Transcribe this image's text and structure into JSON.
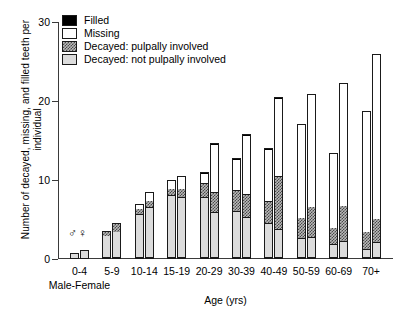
{
  "chart_data": {
    "type": "bar",
    "subtype": "stacked-grouped",
    "title": "",
    "xlabel": "Age (yrs)",
    "ylabel": "Number of decayed, missing, and filled teeth per individual",
    "ylim": [
      0,
      30
    ],
    "yticks": [
      0,
      10,
      20,
      30
    ],
    "grid": false,
    "legend_position": "top-left",
    "group_annotation": "Male-Female",
    "sex_symbols": {
      "male": "♂",
      "female": "♀"
    },
    "categories": [
      "0-4",
      "5-9",
      "10-14",
      "15-19",
      "20-29",
      "30-39",
      "40-49",
      "50-59",
      "60-69",
      "70+"
    ],
    "segments": [
      {
        "name": "Decayed: not pulpally involved",
        "key": "nopulp",
        "color": "#dcdcdc"
      },
      {
        "name": "Decayed: pulpally involved",
        "key": "pulp",
        "color": "#b9b9b9"
      },
      {
        "name": "Missing",
        "key": "missing",
        "color": "#ffffff"
      },
      {
        "name": "Filled",
        "key": "filled",
        "color": "#000000"
      }
    ],
    "series": [
      {
        "name": "Male",
        "bars": [
          {
            "category": "0-4",
            "nopulp": 0.7,
            "pulp": 0.0,
            "missing": 0.0,
            "filled": 0.0,
            "total": 0.7
          },
          {
            "category": "5-9",
            "nopulp": 3.0,
            "pulp": 0.5,
            "missing": 0.0,
            "filled": 0.0,
            "total": 3.5
          },
          {
            "category": "10-14",
            "nopulp": 5.7,
            "pulp": 0.7,
            "missing": 0.6,
            "filled": 0.0,
            "total": 7.0
          },
          {
            "category": "15-19",
            "nopulp": 8.0,
            "pulp": 1.0,
            "missing": 1.0,
            "filled": 0.0,
            "total": 10.0
          },
          {
            "category": "20-29",
            "nopulp": 7.8,
            "pulp": 1.8,
            "missing": 1.3,
            "filled": 0.1,
            "total": 11.0
          },
          {
            "category": "30-39",
            "nopulp": 6.0,
            "pulp": 2.6,
            "missing": 4.0,
            "filled": 0.2,
            "total": 12.8
          },
          {
            "category": "40-49",
            "nopulp": 4.4,
            "pulp": 2.8,
            "missing": 6.7,
            "filled": 0.2,
            "total": 14.1
          },
          {
            "category": "50-59",
            "nopulp": 2.4,
            "pulp": 2.7,
            "missing": 12.0,
            "filled": 0.0,
            "total": 17.1
          },
          {
            "category": "60-69",
            "nopulp": 1.7,
            "pulp": 2.2,
            "missing": 9.5,
            "filled": 0.0,
            "total": 13.4
          },
          {
            "category": "70+",
            "nopulp": 1.0,
            "pulp": 2.3,
            "missing": 15.4,
            "filled": 0.0,
            "total": 18.7
          }
        ]
      },
      {
        "name": "Female",
        "bars": [
          {
            "category": "0-4",
            "nopulp": 1.1,
            "pulp": 0.0,
            "missing": 0.0,
            "filled": 0.0,
            "total": 1.1
          },
          {
            "category": "5-9",
            "nopulp": 3.5,
            "pulp": 1.0,
            "missing": 0.0,
            "filled": 0.0,
            "total": 4.5
          },
          {
            "category": "10-14",
            "nopulp": 6.5,
            "pulp": 1.0,
            "missing": 1.0,
            "filled": 0.0,
            "total": 8.5
          },
          {
            "category": "15-19",
            "nopulp": 7.8,
            "pulp": 1.2,
            "missing": 1.5,
            "filled": 0.0,
            "total": 10.5
          },
          {
            "category": "20-29",
            "nopulp": 5.8,
            "pulp": 2.6,
            "missing": 6.2,
            "filled": 0.1,
            "total": 14.7
          },
          {
            "category": "30-39",
            "nopulp": 5.1,
            "pulp": 3.0,
            "missing": 7.6,
            "filled": 0.1,
            "total": 15.8
          },
          {
            "category": "40-49",
            "nopulp": 3.6,
            "pulp": 6.8,
            "missing": 10.0,
            "filled": 0.1,
            "total": 20.5
          },
          {
            "category": "50-59",
            "nopulp": 2.5,
            "pulp": 4.0,
            "missing": 14.4,
            "filled": 0.0,
            "total": 20.9
          },
          {
            "category": "60-69",
            "nopulp": 2.0,
            "pulp": 4.6,
            "missing": 15.7,
            "filled": 0.0,
            "total": 22.3
          },
          {
            "category": "70+",
            "nopulp": 1.9,
            "pulp": 3.1,
            "missing": 21.0,
            "filled": 0.0,
            "total": 26.0
          }
        ]
      }
    ]
  }
}
